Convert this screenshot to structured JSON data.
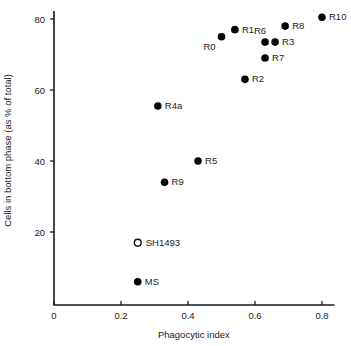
{
  "chart_data": {
    "type": "scatter",
    "title": "",
    "xlabel": "Phagocytic index",
    "ylabel": "Cells in bottom phase (as % of total)",
    "xlim": [
      0,
      0.84
    ],
    "ylim": [
      0,
      82
    ],
    "xticks": [
      "0",
      "0.2",
      "0.4",
      "0.6",
      "0.8"
    ],
    "xtick_values": [
      0,
      0.2,
      0.4,
      0.6,
      0.8
    ],
    "yticks": [
      "20",
      "40",
      "60",
      "80"
    ],
    "ytick_values": [
      20,
      40,
      60,
      80
    ],
    "grid": false,
    "legend": "none",
    "marker_styles": {
      "filled": "filled-circle",
      "open": "open-circle"
    },
    "points": [
      {
        "label": "R0",
        "x": 0.5,
        "y": 75.0,
        "marker": "filled",
        "label_dx": -12,
        "label_dy": 13
      },
      {
        "label": "R1",
        "x": 0.54,
        "y": 77.0,
        "marker": "filled",
        "label_dx": 7,
        "label_dy": 3
      },
      {
        "label": "R6",
        "x": 0.63,
        "y": 73.5,
        "marker": "filled",
        "label_dx": -5,
        "label_dy": -8
      },
      {
        "label": "R3",
        "x": 0.66,
        "y": 73.5,
        "marker": "filled",
        "label_dx": 7,
        "label_dy": 3
      },
      {
        "label": "R7",
        "x": 0.63,
        "y": 69.0,
        "marker": "filled",
        "label_dx": 7,
        "label_dy": 3
      },
      {
        "label": "R8",
        "x": 0.69,
        "y": 78.0,
        "marker": "filled",
        "label_dx": 7,
        "label_dy": 3
      },
      {
        "label": "R10",
        "x": 0.8,
        "y": 80.5,
        "marker": "filled",
        "label_dx": 7,
        "label_dy": 3
      },
      {
        "label": "R2",
        "x": 0.57,
        "y": 63.0,
        "marker": "filled",
        "label_dx": 7,
        "label_dy": 3
      },
      {
        "label": "R4a",
        "x": 0.31,
        "y": 55.5,
        "marker": "filled",
        "label_dx": 7,
        "label_dy": 3
      },
      {
        "label": "R5",
        "x": 0.43,
        "y": 40.0,
        "marker": "filled",
        "label_dx": 7,
        "label_dy": 3
      },
      {
        "label": "R9",
        "x": 0.33,
        "y": 34.0,
        "marker": "filled",
        "label_dx": 7,
        "label_dy": 3
      },
      {
        "label": "SH1493",
        "x": 0.25,
        "y": 17.0,
        "marker": "open",
        "label_dx": 8,
        "label_dy": 3
      },
      {
        "label": "MS",
        "x": 0.25,
        "y": 6.0,
        "marker": "filled",
        "label_dx": 7,
        "label_dy": 3
      }
    ],
    "colors": {
      "marker": "#050505",
      "axis": "#1a1a1a",
      "background": "#ffffff"
    }
  }
}
